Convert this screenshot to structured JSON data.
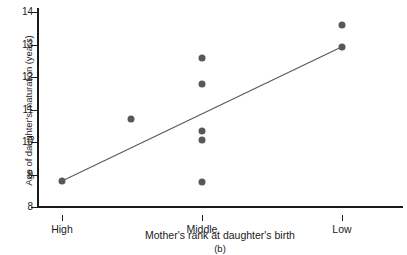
{
  "chart_data": {
    "type": "scatter",
    "title": "",
    "panel_label": "(b)",
    "xlabel": "Mother's rank at daughter's birth",
    "ylabel": "Age of daughter's maturation (years)",
    "x_categories": [
      "High",
      "Middle",
      "Low"
    ],
    "x_category_positions": [
      0,
      1,
      2
    ],
    "xlim": [
      -0.45,
      2.45
    ],
    "ylim": [
      8,
      14.2
    ],
    "yticks": [
      8,
      9,
      10,
      11,
      12,
      13,
      14
    ],
    "ytick_labels": [
      "8",
      "9",
      "10",
      "11",
      "12",
      "13",
      "14"
    ],
    "grid": false,
    "legend": null,
    "marker": {
      "shape": "circle",
      "color": "#585858",
      "size_px": 7
    },
    "points": [
      {
        "x": 0.0,
        "x_label": "High",
        "y": 8.8
      },
      {
        "x": 0.49,
        "x_label": "",
        "y": 10.7
      },
      {
        "x": 1.0,
        "x_label": "Middle",
        "y": 12.6
      },
      {
        "x": 1.0,
        "x_label": "Middle",
        "y": 11.78
      },
      {
        "x": 1.0,
        "x_label": "Middle",
        "y": 10.33
      },
      {
        "x": 1.0,
        "x_label": "Middle",
        "y": 10.05
      },
      {
        "x": 1.0,
        "x_label": "Middle",
        "y": 8.78
      },
      {
        "x": 2.0,
        "x_label": "Low",
        "y": 13.6
      },
      {
        "x": 2.0,
        "x_label": "Low",
        "y": 12.93
      }
    ],
    "trend_line": {
      "type": "linear-fit",
      "color": "#585858",
      "x_start": 0.0,
      "y_start": 8.8,
      "x_end": 2.0,
      "y_end": 12.93
    }
  }
}
